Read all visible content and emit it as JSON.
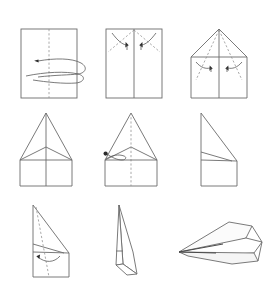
{
  "document": {
    "title": "Paper Airplane Folding Instructions",
    "type": "instructional-diagram",
    "background_color": "#ffffff",
    "line_color": "#6b6b6b",
    "fold_line_color": "#8d8d8d",
    "arrow_color": "#2b2b2b",
    "width": 271,
    "height": 293,
    "panel_count": 9,
    "rows": 3,
    "columns": 3
  },
  "panels": [
    {
      "index": 1,
      "name": "fold-sheet-in-half",
      "row": 1,
      "column": 1,
      "shape": "rectangle",
      "fold_line": "vertical-center-dashed",
      "arrow": "loop-right-to-left",
      "arrow_count": 1,
      "caption": ""
    },
    {
      "index": 2,
      "name": "fold-top-corners-to-center",
      "row": 1,
      "column": 2,
      "shape": "rectangle",
      "fold_line": "two-diagonals-dashed",
      "arrow": "two-curved-down",
      "arrow_count": 2,
      "caption": ""
    },
    {
      "index": 3,
      "name": "fold-new-corners-to-center",
      "row": 1,
      "column": 3,
      "shape": "house-pentagon",
      "fold_line": "two-inner-diagonals-dashed",
      "arrow": "two-curved-down",
      "arrow_count": 2,
      "caption": ""
    },
    {
      "index": 4,
      "name": "completed-nose-folds",
      "row": 2,
      "column": 1,
      "shape": "tall-triangle-on-rectangle",
      "fold_line": "vertical-center-solid",
      "arrow": "none",
      "arrow_count": 0,
      "caption": ""
    },
    {
      "index": 5,
      "name": "fold-body-in-half-backwards",
      "row": 2,
      "column": 2,
      "shape": "tall-triangle-on-rectangle",
      "fold_line": "vertical-center-dashed",
      "arrow": "curl-left",
      "arrow_count": 1,
      "caption": ""
    },
    {
      "index": 6,
      "name": "folded-half-profile",
      "row": 2,
      "column": 3,
      "shape": "right-profile-wedge",
      "fold_line": "none",
      "arrow": "none",
      "arrow_count": 0,
      "caption": ""
    },
    {
      "index": 7,
      "name": "fold-wing-down",
      "row": 3,
      "column": 1,
      "shape": "right-profile-wedge",
      "fold_line": "wing-crease-dashed",
      "arrow": "curved-down-left",
      "arrow_count": 1,
      "caption": ""
    },
    {
      "index": 8,
      "name": "both-wings-folded",
      "row": 3,
      "column": 2,
      "shape": "narrow-profile-with-wing",
      "fold_line": "none",
      "arrow": "none",
      "arrow_count": 0,
      "caption": ""
    },
    {
      "index": 9,
      "name": "finished-paper-airplane",
      "row": 3,
      "column": 3,
      "shape": "perspective-paper-plane",
      "fold_line": "none",
      "arrow": "none",
      "arrow_count": 0,
      "caption": ""
    }
  ]
}
